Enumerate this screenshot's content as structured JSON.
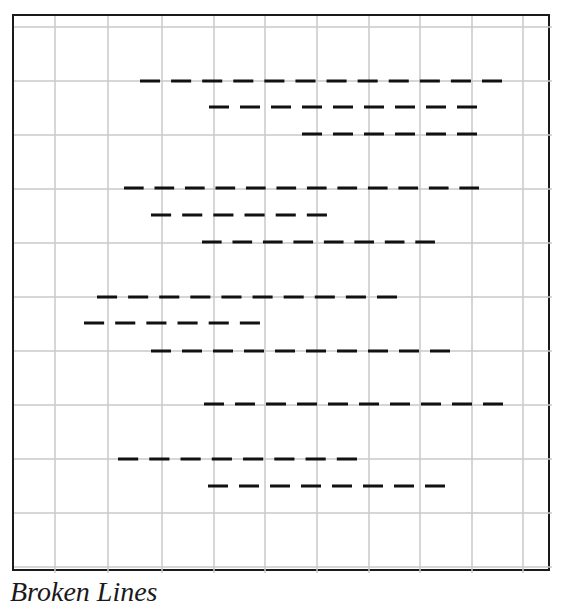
{
  "caption": "Broken Lines",
  "colors": {
    "frame": "#1a1a1a",
    "grid": "#c8c8c8",
    "dash": "#111111",
    "background": "#ffffff"
  },
  "grid": {
    "vertical_x": [
      53,
      106,
      160,
      212,
      263,
      315,
      367,
      418,
      470,
      521
    ],
    "horizontal_y": [
      25,
      79,
      133,
      187,
      241,
      295,
      349,
      403,
      457,
      511,
      565
    ]
  },
  "dash_pattern": {
    "dash": 20,
    "gap": 11,
    "stroke_width": 3
  },
  "lines": [
    {
      "y": 79,
      "x1": 138,
      "x2": 500,
      "dashes": 12
    },
    {
      "y": 105,
      "x1": 207,
      "x2": 475,
      "dashes": 9
    },
    {
      "y": 132,
      "x1": 300,
      "x2": 475,
      "dashes": 6
    },
    {
      "y": 186,
      "x1": 122,
      "x2": 477,
      "dashes": 12
    },
    {
      "y": 213,
      "x1": 149,
      "x2": 325,
      "dashes": 6
    },
    {
      "y": 240,
      "x1": 200,
      "x2": 433,
      "dashes": 8
    },
    {
      "y": 295,
      "x1": 95,
      "x2": 395,
      "dashes": 10
    },
    {
      "y": 321,
      "x1": 82,
      "x2": 258,
      "dashes": 6
    },
    {
      "y": 349,
      "x1": 149,
      "x2": 448,
      "dashes": 10
    },
    {
      "y": 402,
      "x1": 202,
      "x2": 501,
      "dashes": 10
    },
    {
      "y": 457,
      "x1": 116,
      "x2": 355,
      "dashes": 8
    },
    {
      "y": 484,
      "x1": 206,
      "x2": 443,
      "dashes": 8
    }
  ]
}
